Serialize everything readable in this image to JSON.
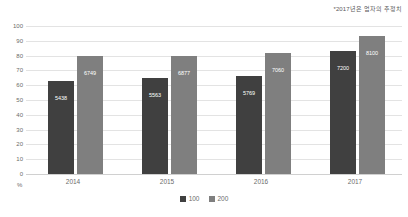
{
  "annotation": "*2017년은 업자의 추정치",
  "axis": {
    "y_unit": "%",
    "y_ticks": [
      100,
      90,
      80,
      70,
      60,
      50,
      40,
      30,
      20,
      10,
      0
    ]
  },
  "legend": {
    "items": [
      {
        "label": "100",
        "color": "#404040"
      },
      {
        "label": "200",
        "color": "#7f7f7f"
      }
    ]
  },
  "chart_data": {
    "type": "bar",
    "title": "",
    "subtitle": "",
    "xlabel": "",
    "ylabel": "%",
    "ylim": [
      0,
      100
    ],
    "ytick_step": 10,
    "grid": true,
    "legend_position": "bottom-center",
    "annotations": [
      "*2017년은 업자의 추정치"
    ],
    "categories": [
      "2014",
      "2015",
      "2016",
      "2017"
    ],
    "series": [
      {
        "name": "100",
        "color": "#404040",
        "values": [
          63,
          65,
          66,
          83
        ],
        "labels": [
          "5438",
          "5563",
          "5769",
          "7200"
        ]
      },
      {
        "name": "200",
        "color": "#7f7f7f",
        "values": [
          80,
          80,
          82,
          93
        ],
        "labels": [
          "6749",
          "6877",
          "7060",
          "8100"
        ]
      }
    ]
  }
}
